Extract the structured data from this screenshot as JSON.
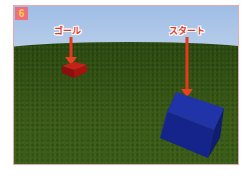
{
  "figure": {
    "badge_number": "6",
    "colors": {
      "frame_border": "#e8a6ad",
      "badge_bg": "#ee6e7e",
      "badge_text": "#f7d04a",
      "arrow": "#e43a20",
      "sky": "#a9c3e6",
      "grass": "#3b5a18",
      "goal_block": "#b01818",
      "start_block": "#1a2fa0"
    }
  },
  "scene": {
    "goal": {
      "label": "ゴール",
      "object": "red-block"
    },
    "start": {
      "label": "スタート",
      "object": "blue-block"
    }
  }
}
